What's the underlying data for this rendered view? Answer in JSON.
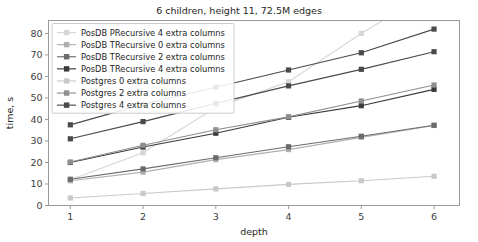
{
  "chart_data": {
    "type": "line",
    "title": "6 children, height 11, 72.5M edges",
    "xlabel": "depth",
    "ylabel": "time, s",
    "x": [
      1,
      2,
      3,
      4,
      5,
      6
    ],
    "xlim": [
      0.7,
      6.35
    ],
    "ylim": [
      0,
      86
    ],
    "xticks": [
      "1",
      "2",
      "3",
      "4",
      "5",
      "6"
    ],
    "yticks": [
      "0",
      "10",
      "20",
      "30",
      "40",
      "50",
      "60",
      "70",
      "80"
    ],
    "grid": false,
    "legend_position": "upper left",
    "marker": "square",
    "series": [
      {
        "name": "PosDB PRecursive 4 extra columns",
        "color": "#d6d6d6",
        "values": [
          12.0,
          24.5,
          45.5,
          57.5,
          80.0,
          100.5
        ]
      },
      {
        "name": "PosDB TRecursive 0 extra columns",
        "color": "#b0b0b0",
        "values": [
          11.5,
          15.5,
          21.3,
          26.0,
          31.7,
          37.2
        ]
      },
      {
        "name": "PosDB TRecursive 2 extra columns",
        "color": "#6b6b6b",
        "values": [
          12.2,
          17.0,
          22.2,
          27.3,
          32.2,
          37.3
        ]
      },
      {
        "name": "PosDB TRecursive 4 extra columns",
        "color": "#3a3a3a",
        "values": [
          20.0,
          27.2,
          33.6,
          41.0,
          46.4,
          54.0
        ]
      },
      {
        "name": "Postgres 0 extra columns",
        "color": "#c9c9c9",
        "values": [
          3.5,
          5.6,
          7.7,
          9.8,
          11.5,
          13.6
        ]
      },
      {
        "name": "Postgres 2 extra columns",
        "color": "#8f8f8f",
        "values": [
          20.2,
          28.0,
          35.2,
          41.2,
          48.6,
          56.0
        ]
      },
      {
        "name": "Postgres 4 extra columns",
        "color": "#4a4a4a",
        "values": [
          31.0,
          39.0,
          47.5,
          55.6,
          63.3,
          71.5
        ]
      }
    ],
    "series_overlay": [
      {
        "name": "Postgres 4 extra columns",
        "values": [
          37.5,
          47.0,
          55.0,
          63.0,
          71.0,
          82.0
        ]
      }
    ]
  }
}
